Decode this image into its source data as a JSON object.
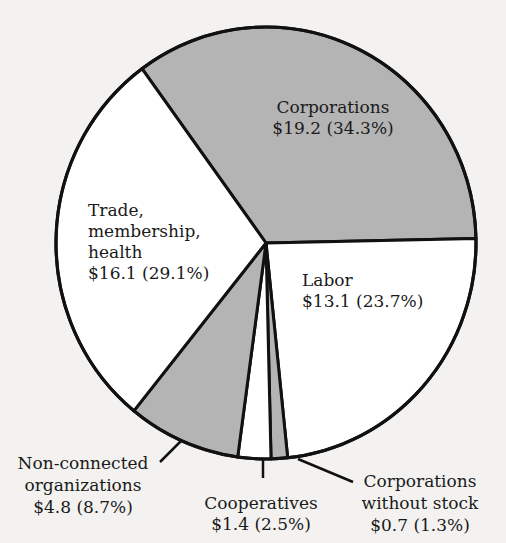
{
  "chart_data": {
    "type": "pie",
    "title": "",
    "unit_prefix": "$",
    "start": "top",
    "direction": "clockwise",
    "slices": [
      {
        "name": "Corporations",
        "label_lines": [
          "Corporations",
          "$19.2 (34.3%)"
        ],
        "value": 19.2,
        "percent": 34.3,
        "color": "#b4b4b4"
      },
      {
        "name": "Labor",
        "label_lines": [
          "Labor",
          "$13.1 (23.7%)"
        ],
        "value": 13.1,
        "percent": 23.7,
        "color": "#ffffff"
      },
      {
        "name": "Corporations without stock",
        "label_lines": [
          "Corporations",
          "without stock",
          "$0.7 (1.3%)"
        ],
        "value": 0.7,
        "percent": 1.3,
        "color": "#b4b4b4"
      },
      {
        "name": "Cooperatives",
        "label_lines": [
          "Cooperatives",
          "$1.4 (2.5%)"
        ],
        "value": 1.4,
        "percent": 2.5,
        "color": "#ffffff"
      },
      {
        "name": "Non-connected organizations",
        "label_lines": [
          "Non-connected",
          "organizations",
          "$4.8 (8.7%)"
        ],
        "value": 4.8,
        "percent": 8.7,
        "color": "#b4b4b4"
      },
      {
        "name": "Trade, membership, health",
        "label_lines": [
          "Trade,",
          "membership,",
          "health",
          "$16.1 (29.1%)"
        ],
        "value": 16.1,
        "percent": 29.1,
        "color": "#ffffff"
      }
    ]
  }
}
